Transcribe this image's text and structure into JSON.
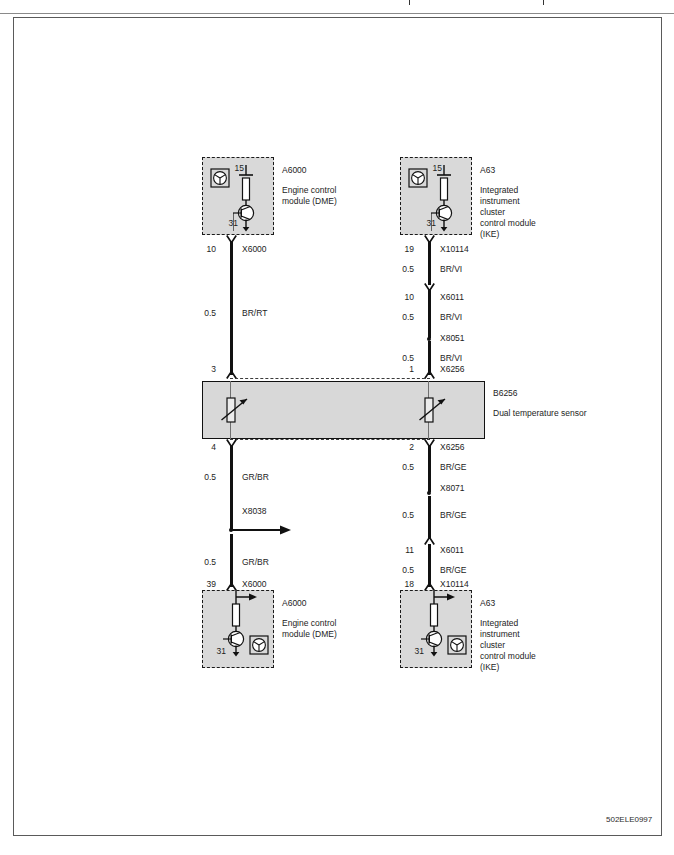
{
  "diagram": {
    "id_code": "502ELE0997",
    "title": ""
  },
  "modules": {
    "top_left": {
      "designation": "A6000",
      "description": "Engine control\nmodule (DME)",
      "desc_lines": [
        "Engine control",
        "module (DME)"
      ],
      "pin_top": "15",
      "pin_bottom": "31"
    },
    "top_right": {
      "designation": "A63",
      "desc_lines": [
        "Integrated",
        "instrument",
        "cluster",
        "control module",
        "(IKE)"
      ],
      "pin_top": "15",
      "pin_bottom": "31"
    },
    "bottom_left": {
      "designation": "A6000",
      "desc_lines": [
        "Engine control",
        "module (DME)"
      ],
      "pin_bottom": "31"
    },
    "bottom_right": {
      "designation": "A63",
      "desc_lines": [
        "Integrated",
        "instrument",
        "cluster",
        "control module",
        "(IKE)"
      ],
      "pin_bottom": "31"
    }
  },
  "sensor": {
    "designation": "B6256",
    "description": "Dual temperature sensor",
    "pin_in_left": "3",
    "pin_in_right": "1",
    "pin_in_right_conn": "X6256",
    "pin_out_left": "4",
    "pin_out_right": "2",
    "pin_out_right_conn": "X6256"
  },
  "left_branch_upper": {
    "pin": "10",
    "connector": "X6000",
    "gauge": "0.5",
    "color": "BR/RT",
    "end_pin": "3"
  },
  "left_branch_lower": {
    "start_pin": "4",
    "gauge_1": "0.5",
    "color_1": "GR/BR",
    "splice": "X8038",
    "gauge_2": "0.5",
    "color_2": "GR/BR",
    "end_pin": "39",
    "end_connector": "X6000"
  },
  "right_branch_upper": {
    "pin": "19",
    "connector_1": "X10114",
    "gauge_1": "0.5",
    "color_1": "BR/VI",
    "pin_2": "10",
    "connector_2": "X6011",
    "gauge_2": "0.5",
    "color_2": "BR/VI",
    "connector_3": "X8051",
    "gauge_3": "0.5",
    "color_3": "BR/VI",
    "end_pin": "1",
    "end_connector": "X6256"
  },
  "right_branch_lower": {
    "start_pin": "2",
    "start_connector": "X6256",
    "gauge_1": "0.5",
    "color_1": "BR/GE",
    "connector_1": "X8071",
    "gauge_2": "0.5",
    "color_2": "BR/GE",
    "pin_2": "11",
    "connector_2": "X6011",
    "gauge_3": "0.5",
    "color_3": "BR/GE",
    "end_pin": "18",
    "end_connector": "X10114"
  },
  "colors": {
    "wire": "#111111",
    "module_fill": "#d9d9d9",
    "sensor_fill": "#d8d8d8",
    "border": "#5a5a5a"
  }
}
